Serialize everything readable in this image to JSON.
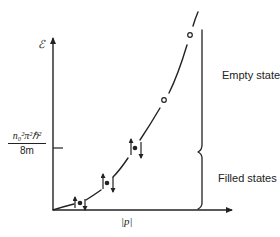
{
  "diagram": {
    "type": "energy-momentum dispersion with filled/empty states",
    "y_axis_label": "ℰ",
    "x_axis_label": "|p|",
    "fermi_tick": {
      "numerator": "n₀²π²ℏ²",
      "denominator": "8m"
    },
    "regions": [
      {
        "label": "Empty states"
      },
      {
        "label": "Filled states"
      }
    ],
    "curve": "parabolic ℰ ∝ |p|²",
    "filled_levels": [
      {
        "spin_pair": "up/down",
        "filled": true
      },
      {
        "spin_pair": "up/down",
        "filled": true
      },
      {
        "spin_pair": "up/down",
        "filled": true
      }
    ],
    "empty_levels": [
      {
        "filled": false
      },
      {
        "filled": false
      }
    ],
    "colors": {
      "ink": "#222222",
      "background": "#ffffff"
    }
  }
}
